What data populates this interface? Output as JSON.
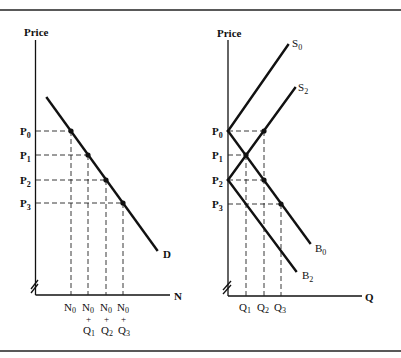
{
  "figure": {
    "left_panel": {
      "y_axis_label": "Price",
      "x_axis_label": "N",
      "curve_label": "D",
      "price_labels": [
        {
          "base": "P",
          "sub": "0"
        },
        {
          "base": "P",
          "sub": "1"
        },
        {
          "base": "P",
          "sub": "2"
        },
        {
          "base": "P",
          "sub": "3"
        }
      ],
      "x_tick_labels": [
        {
          "line1_base": "N",
          "line1_sub": "0",
          "plus": "",
          "line3_base": "",
          "line3_sub": ""
        },
        {
          "line1_base": "N",
          "line1_sub": "0",
          "plus": "+",
          "line3_base": "Q",
          "line3_sub": "1"
        },
        {
          "line1_base": "N",
          "line1_sub": "0",
          "plus": "+",
          "line3_base": "Q",
          "line3_sub": "2"
        },
        {
          "line1_base": "N",
          "line1_sub": "0",
          "plus": "+",
          "line3_base": "Q",
          "line3_sub": "3"
        }
      ]
    },
    "right_panel": {
      "y_axis_label": "Price",
      "x_axis_label": "Q",
      "curves": [
        {
          "base": "S",
          "sub": "0"
        },
        {
          "base": "S",
          "sub": "2"
        },
        {
          "base": "B",
          "sub": "0"
        },
        {
          "base": "B",
          "sub": "2"
        }
      ],
      "price_labels": [
        {
          "base": "P",
          "sub": "0"
        },
        {
          "base": "P",
          "sub": "1"
        },
        {
          "base": "P",
          "sub": "2"
        },
        {
          "base": "P",
          "sub": "3"
        }
      ],
      "x_tick_labels": [
        {
          "base": "Q",
          "sub": "1"
        },
        {
          "base": "Q",
          "sub": "2"
        },
        {
          "base": "Q",
          "sub": "3"
        }
      ]
    }
  }
}
